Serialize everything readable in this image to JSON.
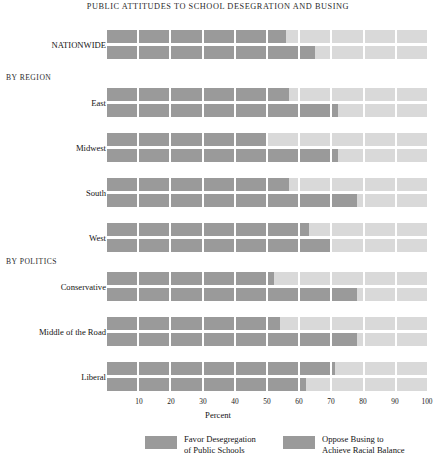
{
  "chart_data": {
    "type": "bar",
    "title": "PUBLIC ATTITUDES TO SCHOOL DESEGRATION AND BUSING",
    "xlabel": "Percent",
    "ylabel": "",
    "xlim": [
      0,
      100
    ],
    "xticks": [
      10,
      20,
      30,
      40,
      50,
      60,
      70,
      80,
      90,
      100
    ],
    "grid": false,
    "legend_position": "bottom",
    "segmented_cells": 10,
    "cell_span": 10,
    "series": [
      {
        "name": "Favor Desegregation of Public Schools",
        "color": "#9a9a9a",
        "values": [
          56,
          57,
          50,
          57,
          63,
          52,
          54,
          71
        ]
      },
      {
        "name": "Oppose Busing to Achieve Racial Balance",
        "color": "#9a9a9a",
        "values": [
          65,
          72,
          72,
          78,
          70,
          78,
          78,
          62
        ]
      }
    ],
    "categories": [
      "NATIONWIDE",
      "East",
      "Midwest",
      "South",
      "West",
      "Conservative",
      "Middle of the Road",
      "Liberal"
    ],
    "groups": [
      {
        "heading": "",
        "categories": [
          "NATIONWIDE"
        ]
      },
      {
        "heading": "BY REGION",
        "categories": [
          "East",
          "Midwest",
          "South",
          "West"
        ]
      },
      {
        "heading": "BY POLITICS",
        "categories": [
          "Conservative",
          "Middle of the Road",
          "Liberal"
        ]
      }
    ]
  },
  "legend": {
    "items": [
      {
        "label_line1": "Favor Desegregation",
        "label_line2": "of Public Schools"
      },
      {
        "label_line1": "Oppose Busing to",
        "label_line2": "Achieve Racial Balance"
      }
    ]
  },
  "rows": [
    {
      "label": "NATIONWIDE",
      "favor": 56,
      "oppose": 65,
      "y": 30,
      "label_y": 41
    },
    {
      "label": "East",
      "favor": 57,
      "oppose": 72,
      "y": 88,
      "label_y": 99
    },
    {
      "label": "Midwest",
      "favor": 50,
      "oppose": 72,
      "y": 133,
      "label_y": 144
    },
    {
      "label": "South",
      "favor": 57,
      "oppose": 78,
      "y": 178,
      "label_y": 189
    },
    {
      "label": "West",
      "favor": 63,
      "oppose": 70,
      "y": 223,
      "label_y": 234
    },
    {
      "label": "Conservative",
      "favor": 52,
      "oppose": 78,
      "y": 272,
      "label_y": 283
    },
    {
      "label": "Middle of the Road",
      "favor": 54,
      "oppose": 78,
      "y": 317,
      "label_y": 328
    },
    {
      "label": "Liberal",
      "favor": 71,
      "oppose": 62,
      "y": 362,
      "label_y": 373
    }
  ],
  "group_headings": [
    {
      "text": "BY REGION",
      "y": 73
    },
    {
      "text": "BY POLITICS",
      "y": 257
    }
  ],
  "axis": {
    "title": "Percent",
    "ticks": [
      10,
      20,
      30,
      40,
      50,
      60,
      70,
      80,
      90,
      100
    ]
  }
}
